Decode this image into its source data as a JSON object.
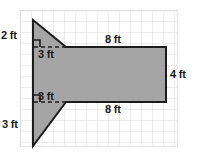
{
  "figure": {
    "colors": {
      "background": "#ffffff",
      "grid_line": "#d8d8d8",
      "grid_line_major": "#c9c9c9",
      "shape_fill": "#9d9d9d",
      "shape_outline": "#1c1c1c",
      "dashed_line": "#1c1c1c",
      "label_text": "#1a1a1a"
    },
    "grid": {
      "cell_size_px": 11,
      "origin_x": 20,
      "origin_y": 10,
      "columns": 14,
      "rows": 12
    },
    "shape": {
      "type": "polygon",
      "outline_points": "33,20 66,47 166,47 166,102 66,102 33,146 33,102 33,47",
      "rectangle": {
        "x": 66,
        "y": 47,
        "width": 100,
        "height": 55
      },
      "top_triangle": {
        "apex": "33,20",
        "corner": "33,47",
        "base_end": "66,47"
      },
      "bottom_triangle": {
        "apex": "33,146",
        "corner": "33,102",
        "base_end": "66,102"
      }
    },
    "dashed_segments": [
      {
        "x1": 33,
        "y1": 47,
        "x2": 66,
        "y2": 47
      },
      {
        "x1": 33,
        "y1": 102,
        "x2": 66,
        "y2": 102
      }
    ],
    "right_angle_marks": [
      {
        "x": 33,
        "y": 47,
        "size": 7,
        "dir_x": 1,
        "dir_y": -1
      },
      {
        "x": 33,
        "y": 102,
        "size": 7,
        "dir_x": 1,
        "dir_y": -1
      }
    ],
    "labels": [
      {
        "id": "top-height",
        "text": "2 ft",
        "value": 2,
        "unit": "ft"
      },
      {
        "id": "top-base",
        "text": "3 ft",
        "value": 3,
        "unit": "ft"
      },
      {
        "id": "bottom-base",
        "text": "3 ft",
        "value": 3,
        "unit": "ft"
      },
      {
        "id": "bottom-height",
        "text": "3 ft",
        "value": 3,
        "unit": "ft"
      },
      {
        "id": "rect-top",
        "text": "8 ft",
        "value": 8,
        "unit": "ft"
      },
      {
        "id": "rect-bottom",
        "text": "8 ft",
        "value": 8,
        "unit": "ft"
      },
      {
        "id": "rect-right",
        "text": "4 ft",
        "value": 4,
        "unit": "ft"
      }
    ]
  }
}
